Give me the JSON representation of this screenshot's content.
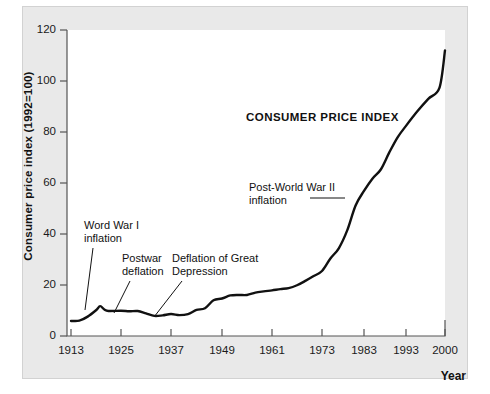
{
  "chart_data": {
    "type": "line",
    "title": "CONSUMER PRICE INDEX",
    "xlabel": "Year",
    "ylabel": "Consumer price index (1992=100)",
    "xlim": [
      1913,
      2000
    ],
    "ylim": [
      0,
      120
    ],
    "grid": false,
    "legend": "none",
    "xticks": [
      "1913",
      "1925",
      "1937",
      "1949",
      "1961",
      "1973",
      "1983",
      "1993",
      "2000"
    ],
    "xtick_values": [
      1913,
      1925,
      1937,
      1949,
      1961,
      1973,
      1983,
      1993,
      2000
    ],
    "yticks": [
      "0",
      "20",
      "40",
      "60",
      "80",
      "100",
      "120"
    ],
    "ytick_values": [
      0,
      20,
      40,
      60,
      80,
      100,
      120
    ],
    "series": [
      {
        "name": "Consumer price index",
        "color": "#111111",
        "x": [
          1913,
          1915,
          1917,
          1919,
          1920,
          1921,
          1922,
          1925,
          1927,
          1929,
          1931,
          1933,
          1935,
          1937,
          1939,
          1941,
          1943,
          1945,
          1947,
          1949,
          1951,
          1953,
          1955,
          1957,
          1959,
          1961,
          1963,
          1965,
          1967,
          1969,
          1971,
          1973,
          1975,
          1977,
          1979,
          1981,
          1983,
          1985,
          1987,
          1989,
          1991,
          1993,
          1995,
          1997,
          1999,
          2000
        ],
        "y": [
          5.9,
          6.0,
          7.6,
          10.1,
          11.7,
          10.4,
          9.8,
          9.9,
          9.7,
          9.8,
          8.9,
          7.9,
          8.1,
          8.6,
          8.2,
          8.6,
          10.2,
          10.9,
          14.0,
          14.7,
          15.9,
          16.1,
          16.1,
          17.0,
          17.5,
          17.9,
          18.4,
          18.8,
          19.9,
          21.6,
          23.5,
          25.5,
          30.4,
          34.4,
          41.4,
          51.2,
          56.9,
          61.7,
          65.3,
          71.9,
          77.9,
          82.4,
          88.0,
          93.0,
          97.3,
          112.0
        ],
        "note": "Long-run U.S. consumer price index, 1992 = 100"
      }
    ],
    "annotations": [
      {
        "id": "ww1",
        "text": "Word War I\ninflation",
        "x": 1918,
        "y": 38
      },
      {
        "id": "postwar",
        "text": "Postwar\ndeflation",
        "x": 1927,
        "y": 27
      },
      {
        "id": "depression",
        "text": "Deflation of Great\nDepression",
        "x": 1938,
        "y": 27
      },
      {
        "id": "ww2",
        "text": "Post-World War II\ninflation",
        "x": 1966,
        "y": 53
      }
    ]
  },
  "axes": {
    "y_title": "Consumer price index (1992=100)",
    "x_title": "Year"
  },
  "labels": {
    "title": "CONSUMER PRICE INDEX",
    "ann_ww1": "Word War I\ninflation",
    "ann_postwar": "Postwar\ndeflation",
    "ann_depression": "Deflation of Great\nDepression",
    "ann_ww2": "Post-World War II\ninflation"
  },
  "ytick_labels": [
    "120",
    "100",
    "80",
    "60",
    "40",
    "20",
    "0"
  ],
  "xtick_labels": [
    "1913",
    "1925",
    "1937",
    "1949",
    "1961",
    "1973",
    "1983",
    "1993",
    "2000"
  ],
  "colors": {
    "line": "#111111",
    "panel": "#e9e9e9",
    "plot": "#ffffff",
    "axis": "#555555"
  }
}
